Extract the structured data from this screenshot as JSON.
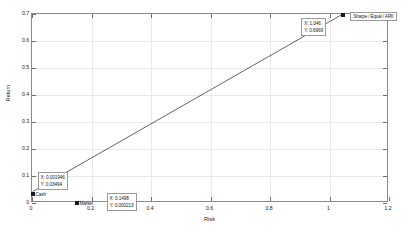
{
  "chart_data": {
    "type": "line",
    "title": "",
    "xlabel": "Risk",
    "ylabel": "Return",
    "xlim": [
      0,
      1.2
    ],
    "ylim": [
      0,
      0.7
    ],
    "xticks": [
      "0",
      "0.2",
      "0.4",
      "0.6",
      "0.8",
      "1",
      "1.2"
    ],
    "xtick_values": [
      0,
      0.2,
      0.4,
      0.6,
      0.8,
      1,
      1.2
    ],
    "yticks": [
      "0",
      "0.1",
      "0.2",
      "0.3",
      "0.4",
      "0.5",
      "0.6",
      "0.7"
    ],
    "ytick_values": [
      0,
      0.1,
      0.2,
      0.3,
      0.4,
      0.5,
      0.6,
      0.7
    ],
    "grid": true,
    "legend_position": "top-right",
    "series": [
      {
        "name": "Sharpe / Equal / ARK",
        "x": [
          0.001946,
          1.046
        ],
        "y": [
          0.03494,
          0.6969
        ],
        "color": "#3a3a3a"
      }
    ],
    "markers": [
      {
        "label": "Cash",
        "x": 0.001946,
        "y": 0.03494
      },
      {
        "label": "Market",
        "x": 0.1498,
        "y": 0.000213
      },
      {
        "label": "",
        "x": 1.046,
        "y": 0.6969
      }
    ],
    "datatips": [
      {
        "x_text": "X: 0.001946",
        "y_text": "Y: 0.03494",
        "x": 0.001946,
        "y": 0.03494
      },
      {
        "x_text": "X: 0.1498",
        "y_text": "Y: 0.000213",
        "x": 0.1498,
        "y": 0.000213
      },
      {
        "x_text": "X: 1.046",
        "y_text": "Y: 0.6969",
        "x": 1.046,
        "y": 0.6969
      }
    ],
    "legend_entries": [
      "Sharpe / Equal / ARK"
    ]
  },
  "axes": {
    "x_title": "Risk",
    "y_title": "Return"
  },
  "colors": {
    "line": "#3a3a3a",
    "axis": "#8a8a8a",
    "grid": "#e8e8e8",
    "text": "#1a1a1a"
  }
}
